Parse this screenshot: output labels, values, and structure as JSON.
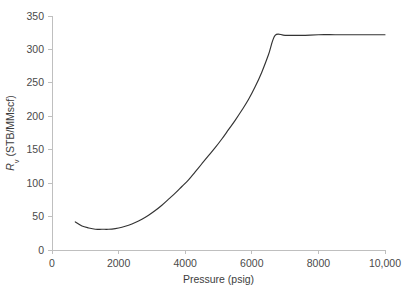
{
  "chart_data": {
    "type": "line",
    "title": "",
    "xlabel": "Pressure (psig)",
    "ylabel": "Rv (STB/MMscf)",
    "ylabel_symbol": "R",
    "ylabel_subscript": "v",
    "ylabel_units": " (STB/MMscf)",
    "xlim": [
      0,
      10000
    ],
    "ylim": [
      0,
      350
    ],
    "xticks": [
      0,
      2000,
      4000,
      6000,
      8000,
      10000
    ],
    "xtick_labels": [
      "0",
      "2000",
      "4000",
      "6000",
      "8000",
      "10,000"
    ],
    "yticks": [
      0,
      50,
      100,
      150,
      200,
      250,
      300,
      350
    ],
    "ytick_labels": [
      "0",
      "50",
      "100",
      "150",
      "200",
      "250",
      "300",
      "350"
    ],
    "grid": false,
    "legend": false,
    "legend_position": "none",
    "line_color": "#333333",
    "axis_color": "#bfbfbf",
    "background_color": "#ffffff",
    "series": [
      {
        "name": "Rv",
        "x": [
          700,
          900,
          1100,
          1300,
          1500,
          1700,
          1900,
          2100,
          2300,
          2500,
          2700,
          2900,
          3100,
          3300,
          3500,
          3700,
          3900,
          4100,
          4300,
          4500,
          4700,
          4900,
          5100,
          5300,
          5500,
          5700,
          5900,
          6100,
          6300,
          6500,
          6700,
          7000,
          7500,
          8000,
          8500,
          9000,
          9500,
          10000
        ],
        "y": [
          42,
          36,
          33,
          31,
          31,
          31,
          32,
          34,
          37,
          41,
          46,
          52,
          59,
          67,
          76,
          85,
          95,
          105,
          117,
          129,
          141,
          153,
          166,
          180,
          194,
          209,
          225,
          244,
          266,
          292,
          321,
          321,
          321,
          322,
          322,
          322,
          322,
          322
        ]
      }
    ],
    "annotations": [
      {
        "text": "minimum near 1500 psig",
        "x": 1500,
        "y": 31
      },
      {
        "text": "plateau onset near 6700 psig",
        "x": 6700,
        "y": 321
      }
    ]
  }
}
